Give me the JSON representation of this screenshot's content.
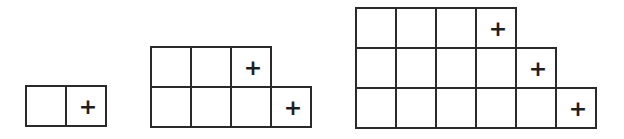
{
  "diagram": {
    "cell_size": 41,
    "border_color": "#2a2a2a",
    "mark_symbol": "+",
    "figures": [
      {
        "id": "figure-1",
        "left": 25,
        "top": 85,
        "rows": [
          {
            "cells": 2,
            "marked_index": 1
          }
        ]
      },
      {
        "id": "figure-2",
        "left": 150,
        "top": 46,
        "rows": [
          {
            "cells": 3,
            "marked_index": 2
          },
          {
            "cells": 4,
            "marked_index": 3
          }
        ]
      },
      {
        "id": "figure-3",
        "left": 355,
        "top": 7,
        "rows": [
          {
            "cells": 4,
            "marked_index": 3
          },
          {
            "cells": 5,
            "marked_index": 4
          },
          {
            "cells": 6,
            "marked_index": 5
          }
        ]
      }
    ]
  }
}
